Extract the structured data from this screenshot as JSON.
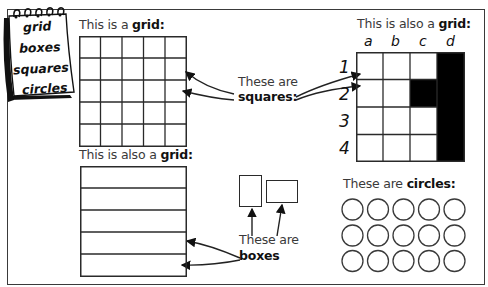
{
  "notepad": {
    "words": [
      "grid",
      "boxes",
      "squares",
      "circles"
    ]
  },
  "grid_square": {
    "label_prefix": "This is a ",
    "label_bold": "grid:",
    "rows": 5,
    "cols": 5
  },
  "grid_lettered": {
    "label_prefix": "This is also a ",
    "label_bold": "grid:",
    "column_labels": [
      "a",
      "b",
      "c",
      "d"
    ],
    "row_labels": [
      "1",
      "2",
      "3",
      "4"
    ],
    "filled_cells": [
      "d1",
      "d2",
      "d3",
      "d4",
      "c2"
    ],
    "fill_color": "#000000"
  },
  "grid_rows": {
    "label_prefix": "This is also a ",
    "label_bold": "grid:",
    "rows": 5
  },
  "squares_callout": {
    "line1": "These are",
    "line2": "squares:"
  },
  "boxes_callout": {
    "line1": "These are",
    "line2": "boxes"
  },
  "circles_section": {
    "label_prefix": "These are ",
    "label_bold": "circles:",
    "rows": 3,
    "cols": 5
  },
  "colors": {
    "line": "#2a2a2a",
    "text": "#3a3a3a",
    "fill": "#000000",
    "background": "#ffffff"
  }
}
